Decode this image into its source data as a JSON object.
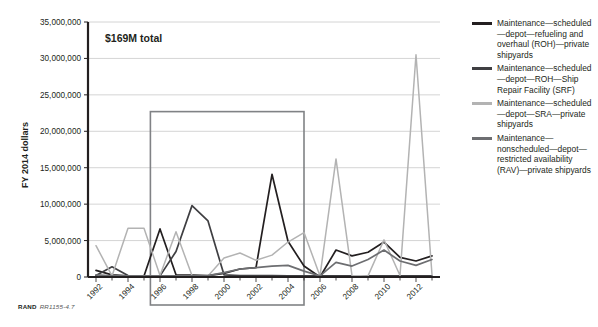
{
  "figure": {
    "annotation": "$169M total",
    "footer_mark": "RAND",
    "footer_id": "RR1155-4.7"
  },
  "chart_data": {
    "type": "line",
    "title": "",
    "subtitle": "",
    "xlabel": "",
    "ylabel": "FY 2014 dollars",
    "xlim": [
      1991.5,
      2013.5
    ],
    "ylim": [
      0,
      35000000
    ],
    "ytick_values": [
      0,
      5000000,
      10000000,
      15000000,
      20000000,
      25000000,
      30000000,
      35000000
    ],
    "ytick_labels": [
      "0",
      "5,000,000",
      "10,000,000",
      "15,000,000",
      "20,000,000",
      "25,000,000",
      "30,000,000",
      "35,000,000"
    ],
    "grid": true,
    "grid_axis": "y",
    "legend_position": "right",
    "x": [
      1992,
      1993,
      1994,
      1995,
      1996,
      1997,
      1998,
      1999,
      2000,
      2001,
      2002,
      2003,
      2004,
      2005,
      2006,
      2007,
      2008,
      2009,
      2010,
      2011,
      2012,
      2013
    ],
    "xtick_labels": [
      "1992",
      "1994",
      "1996",
      "1998",
      "2000",
      "2002",
      "2004",
      "2006",
      "2008",
      "2010",
      "2012"
    ],
    "xtick_values": [
      1992,
      1994,
      1996,
      1998,
      2000,
      2002,
      2004,
      2006,
      2008,
      2010,
      2012
    ],
    "series": [
      {
        "name": "Maintenance—scheduled—depot—refueling and overhaul (ROH)—private shipyards",
        "color": "#231f20",
        "values": [
          900000,
          300000,
          150000,
          150000,
          6600000,
          300000,
          250000,
          200000,
          500000,
          1100000,
          1300000,
          14100000,
          4900000,
          1500000,
          0,
          3700000,
          2900000,
          3400000,
          4800000,
          2700000,
          2200000,
          2900000
        ]
      },
      {
        "name": "Maintenance—scheduled—depot—ROH—Ship Repair Facility (SRF)",
        "color": "#3f3f42",
        "values": [
          200000,
          1400000,
          200000,
          150000,
          150000,
          3500000,
          9800000,
          7700000,
          300000,
          200000,
          200000,
          200000,
          150000,
          150000,
          150000,
          150000,
          150000,
          150000,
          150000,
          150000,
          150000,
          150000
        ]
      },
      {
        "name": "Maintenance—scheduled—depot—SRA—private shipyards",
        "color": "#b3b3b3",
        "values": [
          4300000,
          150000,
          6700000,
          6700000,
          200000,
          6200000,
          200000,
          150000,
          2600000,
          3300000,
          2300000,
          3000000,
          4800000,
          6100000,
          150000,
          16200000,
          200000,
          150000,
          5100000,
          200000,
          30500000,
          300000
        ]
      },
      {
        "name": "Maintenance—nonscheduled—depot—restricted availability (RAV)—private shipyards",
        "color": "#6d6e71",
        "values": [
          300000,
          150000,
          150000,
          150000,
          150000,
          150000,
          150000,
          200000,
          600000,
          1100000,
          1300000,
          1500000,
          1600000,
          800000,
          150000,
          2000000,
          1500000,
          2400000,
          3700000,
          2200000,
          1600000,
          2400000
        ]
      }
    ],
    "highlight_box": {
      "x_start": 1995.4,
      "x_end": 2005.0,
      "y_top": 22700000,
      "color": "#808285"
    }
  },
  "legend": {
    "items": [
      {
        "label": "Maintenance—scheduled—depot—refueling and overhaul (ROH)—private shipyards",
        "color": "#231f20"
      },
      {
        "label": "Maintenance—scheduled—depot—ROH—Ship Repair Facility (SRF)",
        "color": "#3f3f42"
      },
      {
        "label": "Maintenance—scheduled—depot—SRA—private shipyards",
        "color": "#b3b3b3"
      },
      {
        "label": "Maintenance—nonscheduled—depot—restricted availability (RAV)—private shipyards",
        "color": "#6d6e71"
      }
    ]
  }
}
